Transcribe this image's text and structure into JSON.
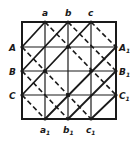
{
  "diagram": {
    "type": "grid-diagonal-scheme",
    "colors": {
      "ink": "#1a1a1a",
      "background": "#ffffff"
    },
    "frame": {
      "x0": 22,
      "y0": 22,
      "x1": 116,
      "y1": 119
    },
    "top_labels": [
      {
        "text": "a",
        "x": 45
      },
      {
        "text": "b",
        "x": 68
      },
      {
        "text": "c",
        "x": 91
      }
    ],
    "bottom_labels": [
      {
        "text": "a",
        "sub": "1",
        "x": 45
      },
      {
        "text": "b",
        "sub": "1",
        "x": 68
      },
      {
        "text": "c",
        "sub": "1",
        "x": 91
      }
    ],
    "left_labels": [
      {
        "text": "A",
        "y": 47
      },
      {
        "text": "B",
        "y": 71
      },
      {
        "text": "C",
        "y": 95
      }
    ],
    "right_labels": [
      {
        "text": "A",
        "sub": "1",
        "y": 47
      },
      {
        "text": "B",
        "sub": "1",
        "y": 71
      },
      {
        "text": "C",
        "sub": "1",
        "y": 95
      }
    ],
    "solid_diagonals": [
      {
        "from": "A",
        "to": "a"
      },
      {
        "from": "B",
        "to": "b"
      },
      {
        "from": "C",
        "to": "c"
      },
      {
        "from": "a1",
        "to": "A1"
      },
      {
        "from": "b1",
        "to": "B1"
      },
      {
        "from": "c1",
        "to": "C1"
      }
    ],
    "dashed_diagonals": [
      {
        "from": "C",
        "to": "a1"
      },
      {
        "from": "B",
        "to": "b1"
      },
      {
        "from": "A",
        "to": "c1"
      },
      {
        "from": "a",
        "to": "C1"
      },
      {
        "from": "b",
        "to": "B1"
      },
      {
        "from": "c",
        "to": "A1"
      }
    ]
  }
}
